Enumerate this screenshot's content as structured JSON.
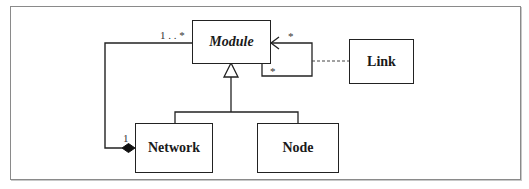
{
  "diagram": {
    "type": "UML class diagram",
    "classes": [
      {
        "id": "module",
        "name": "Module",
        "abstract": true
      },
      {
        "id": "link",
        "name": "Link",
        "abstract": false
      },
      {
        "id": "network",
        "name": "Network",
        "abstract": false
      },
      {
        "id": "node",
        "name": "Node",
        "abstract": false
      }
    ],
    "relationships": [
      {
        "type": "composition",
        "whole": "Network",
        "part": "Module",
        "whole_multiplicity": "1",
        "part_multiplicity": "1..*"
      },
      {
        "type": "generalization",
        "parent": "Module",
        "children": [
          "Network",
          "Node"
        ]
      },
      {
        "type": "association",
        "from": "Module",
        "to": "Module",
        "multiplicity_source": "*",
        "multiplicity_target": "*",
        "association_class": "Link"
      }
    ],
    "labels": {
      "module": "Module",
      "link": "Link",
      "network": "Network",
      "node": "Node",
      "composition_part_mult": "1 . . *",
      "composition_whole_mult": "1",
      "self_assoc_mult_top": "*",
      "self_assoc_mult_bottom": "*"
    },
    "colors": {
      "line": "#222222",
      "frame": "#8a8a8a",
      "background": "#ffffff"
    }
  }
}
